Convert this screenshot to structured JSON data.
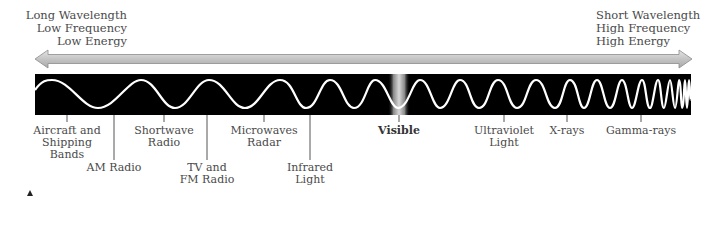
{
  "header": {
    "left": {
      "lines": [
        "Long Wavelength",
        "Low Frequency",
        "Low Energy"
      ]
    },
    "right": {
      "lines": [
        "Short Wavelength",
        "High Frequency",
        "High Energy"
      ]
    }
  },
  "arrow": {
    "direction": "bidirectional",
    "left_tip_x": 35,
    "right_tip_x": 692,
    "color": "#c8c8c8"
  },
  "band": {
    "color": "#000000",
    "wave_color": "#ffffff",
    "visible_band_color": "#bdbdbd"
  },
  "labels": [
    {
      "id": "aircraft",
      "lines": [
        "Aircraft and",
        "Shipping",
        "Bands"
      ],
      "tick_x": 67,
      "bold": false
    },
    {
      "id": "am-radio",
      "lines": [
        "AM Radio"
      ],
      "tick_x": 114,
      "bold": false
    },
    {
      "id": "shortwave",
      "lines": [
        "Shortwave",
        "Radio"
      ],
      "tick_x": 164,
      "bold": false
    },
    {
      "id": "tv-fm",
      "lines": [
        "TV and",
        "FM Radio"
      ],
      "tick_x": 207,
      "bold": false
    },
    {
      "id": "microwaves",
      "lines": [
        "Microwaves",
        "Radar"
      ],
      "tick_x": 264,
      "bold": false
    },
    {
      "id": "infrared",
      "lines": [
        "Infrared",
        "Light"
      ],
      "tick_x": 310,
      "bold": false
    },
    {
      "id": "visible",
      "lines": [
        "Visible"
      ],
      "tick_x": 399,
      "bold": true
    },
    {
      "id": "ultraviolet",
      "lines": [
        "Ultraviolet",
        "Light"
      ],
      "tick_x": 504,
      "bold": false
    },
    {
      "id": "x-rays",
      "lines": [
        "X-rays"
      ],
      "tick_x": 567,
      "bold": false
    },
    {
      "id": "gamma-rays",
      "lines": [
        "Gamma-rays"
      ],
      "tick_x": 641,
      "bold": false
    }
  ]
}
